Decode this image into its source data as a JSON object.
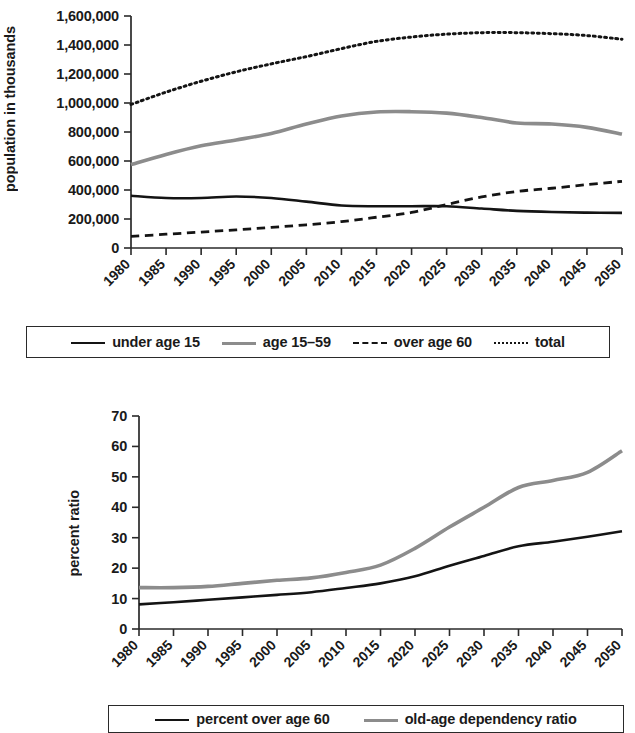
{
  "chart_data": [
    {
      "id": "population-by-age-group",
      "type": "line",
      "title": "",
      "xlabel": "",
      "ylabel": "population in thousands",
      "xlim": [
        1980,
        2050
      ],
      "ylim": [
        0,
        1600000
      ],
      "ytick_labels": [
        "1,600,000",
        "1,400,000",
        "1,200,000",
        "1,000,000",
        "800,000",
        "600,000",
        "400,000",
        "200,000",
        "0"
      ],
      "ytick_values": [
        1600000,
        1400000,
        1200000,
        1000000,
        800000,
        600000,
        400000,
        200000,
        0
      ],
      "grid": false,
      "legend_position": "bottom",
      "x": [
        1980,
        1985,
        1990,
        1995,
        2000,
        2005,
        2010,
        2015,
        2020,
        2025,
        2030,
        2035,
        2040,
        2045,
        2050
      ],
      "categories": [
        "1980",
        "1985",
        "1990",
        "1995",
        "2000",
        "2005",
        "2010",
        "2015",
        "2020",
        "2025",
        "2030",
        "2035",
        "2040",
        "2045",
        "2050"
      ],
      "series": [
        {
          "name": "under age 15",
          "style": "solid",
          "color": "#141414",
          "width": 2.6,
          "values": [
            360000,
            345000,
            345000,
            355000,
            345000,
            320000,
            293000,
            288000,
            288000,
            288000,
            272000,
            256000,
            248000,
            244000,
            242000
          ]
        },
        {
          "name": "age 15–59",
          "style": "solid",
          "color": "#8c8c8c",
          "width": 3.6,
          "values": [
            575000,
            645000,
            705000,
            745000,
            790000,
            855000,
            910000,
            938000,
            940000,
            930000,
            900000,
            862000,
            855000,
            832000,
            786000
          ]
        },
        {
          "name": "over age 60",
          "style": "dashed",
          "color": "#141414",
          "width": 2.8,
          "values": [
            80000,
            95000,
            110000,
            125000,
            142000,
            160000,
            182000,
            212000,
            245000,
            300000,
            352000,
            390000,
            412000,
            437000,
            460000
          ]
        },
        {
          "name": "total",
          "style": "dotted",
          "color": "#141414",
          "width": 3.0,
          "values": [
            990000,
            1075000,
            1150000,
            1215000,
            1270000,
            1320000,
            1375000,
            1425000,
            1455000,
            1475000,
            1485000,
            1485000,
            1478000,
            1465000,
            1440000
          ]
        }
      ]
    },
    {
      "id": "percent-ratio-aging",
      "type": "line",
      "title": "",
      "xlabel": "",
      "ylabel": "percent ratio",
      "xlim": [
        1980,
        2050
      ],
      "ylim": [
        0,
        70
      ],
      "ytick_labels": [
        "70",
        "60",
        "50",
        "40",
        "30",
        "20",
        "10",
        "0"
      ],
      "ytick_values": [
        70,
        60,
        50,
        40,
        30,
        20,
        10,
        0
      ],
      "grid": false,
      "legend_position": "bottom",
      "x": [
        1980,
        1985,
        1990,
        1995,
        2000,
        2005,
        2010,
        2015,
        2020,
        2025,
        2030,
        2035,
        2040,
        2045,
        2050
      ],
      "categories": [
        "1980",
        "1985",
        "1990",
        "1995",
        "2000",
        "2005",
        "2010",
        "2015",
        "2020",
        "2025",
        "2030",
        "2035",
        "2040",
        "2045",
        "2050"
      ],
      "series": [
        {
          "name": "percent over age 60",
          "style": "solid",
          "color": "#141414",
          "width": 2.6,
          "values": [
            8.1,
            8.8,
            9.6,
            10.4,
            11.2,
            12.1,
            13.5,
            15.0,
            17.3,
            20.8,
            24.0,
            27.2,
            28.7,
            30.3,
            32.1
          ]
        },
        {
          "name": "old-age dependency ratio",
          "style": "solid",
          "color": "#8c8c8c",
          "width": 3.6,
          "values": [
            13.6,
            13.6,
            14.0,
            15.0,
            16.0,
            16.8,
            18.6,
            21.0,
            26.5,
            33.5,
            40.0,
            46.5,
            48.8,
            51.5,
            58.6
          ]
        }
      ]
    }
  ],
  "figures": {
    "top": {
      "ylabel": "population in thousands",
      "legend": [
        {
          "label": "under age 15",
          "swatch": "sw-solid-dark"
        },
        {
          "label": "age 15–59",
          "swatch": "sw-solid-gray"
        },
        {
          "label": "over age 60",
          "swatch": "sw-dashed"
        },
        {
          "label": "total",
          "swatch": "sw-dotted"
        }
      ]
    },
    "bottom": {
      "ylabel": "percent ratio",
      "legend": [
        {
          "label": "percent over age 60",
          "swatch": "sw-solid-dark"
        },
        {
          "label": "old-age dependency ratio",
          "swatch": "sw-solid-gray"
        }
      ]
    }
  }
}
